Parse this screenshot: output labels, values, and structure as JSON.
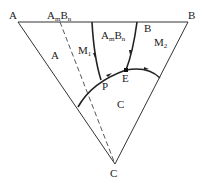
{
  "diagram": {
    "type": "ternary phase diagram",
    "vertices": {
      "A": "A",
      "B": "B",
      "C": "C"
    },
    "compound": {
      "base": "A",
      "sub_m": "m",
      "base2": "B",
      "sub_n": "n"
    },
    "regions": {
      "A": "A",
      "M1_base": "M",
      "M1_sub": "1",
      "AmBn_base": "A",
      "AmBn_m": "m",
      "AmBn_B": "B",
      "AmBn_n": "n",
      "B": "B",
      "M2_base": "M",
      "M2_sub": "2",
      "C": "C"
    },
    "points": {
      "P": "P",
      "E": "E"
    },
    "colors": {
      "line": "#333333",
      "background": "#ffffff"
    }
  }
}
